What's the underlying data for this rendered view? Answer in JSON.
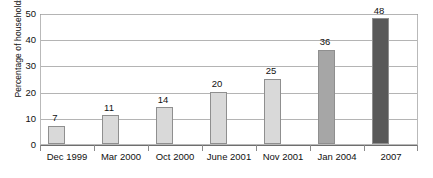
{
  "chart_data": {
    "type": "bar",
    "title": "",
    "subtitle": "",
    "xlabel": "",
    "ylabel": "Percentage of households",
    "categories": [
      "Dec 1999",
      "Mar 2000",
      "Oct 2000",
      "June 2001",
      "Nov 2001",
      "Jan 2004",
      "2007"
    ],
    "values": [
      7,
      11,
      14,
      20,
      25,
      36,
      48
    ],
    "data_labels": [
      "7",
      "11",
      "14",
      "20",
      "25",
      "36",
      "48"
    ],
    "bar_colors": [
      "#d9d9d9",
      "#d9d9d9",
      "#d9d9d9",
      "#d9d9d9",
      "#d9d9d9",
      "#a6a6a6",
      "#595959"
    ],
    "ylim": [
      0,
      50
    ],
    "yticks": [
      0,
      10,
      20,
      30,
      40,
      50
    ],
    "ytick_labels": [
      "0",
      "10",
      "20",
      "30",
      "40",
      "50"
    ],
    "grid": true,
    "grid_axis": "y",
    "legend": false,
    "legend_position": "none"
  },
  "colors": {
    "bar_light": "#d9d9d9",
    "bar_medium": "#a6a6a6",
    "bar_dark": "#595959",
    "bar_border": "#8f8f8f",
    "gridline": "#b4b4b4",
    "axis": "#6e6e6e",
    "text": "#111111",
    "background": "#ffffff"
  }
}
